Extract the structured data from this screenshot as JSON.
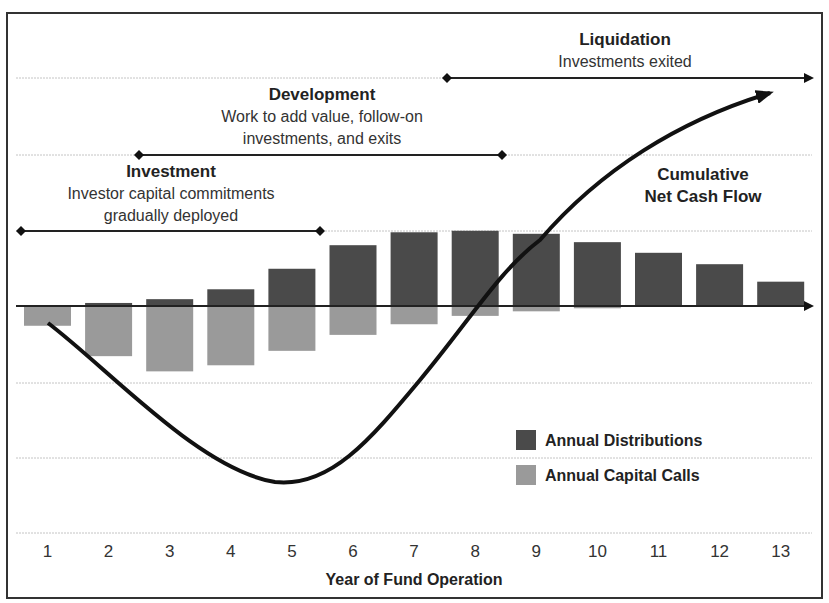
{
  "chart_data": {
    "type": "bar",
    "title": "",
    "xlabel": "Year of Fund Operation",
    "ylabel": "",
    "categories": [
      "1",
      "2",
      "3",
      "4",
      "5",
      "6",
      "7",
      "8",
      "9",
      "10",
      "11",
      "12",
      "13"
    ],
    "series": [
      {
        "name": "Annual Distributions",
        "color": "#4a4a4a",
        "values": [
          0,
          0.04,
          0.09,
          0.22,
          0.49,
          0.8,
          0.97,
          0.99,
          0.95,
          0.84,
          0.7,
          0.55,
          0.32
        ]
      },
      {
        "name": "Annual Capital Calls",
        "color": "#9a9a9a",
        "values": [
          -0.26,
          -0.66,
          -0.86,
          -0.78,
          -0.59,
          -0.38,
          -0.24,
          -0.13,
          -0.07,
          -0.03,
          0,
          0,
          0
        ]
      },
      {
        "name": "Cumulative Net Cash Flow",
        "type": "line",
        "color": "#111111",
        "values": [
          -0.25,
          -1.0,
          -1.7,
          -2.2,
          -2.3,
          -2.1,
          -1.2,
          0.0,
          1.1,
          2.0,
          2.6,
          3.0,
          3.1
        ]
      }
    ],
    "ylim": [
      -3,
      3
    ],
    "grid": true,
    "legend_position": "lower right inside plot",
    "annotations": [
      {
        "label": "Investment",
        "sub": "Investor capital commitments gradually deployed",
        "span": [
          1,
          5.5
        ]
      },
      {
        "label": "Development",
        "sub": "Work to add value, follow-on investments, and exits",
        "span": [
          2.5,
          8.5
        ]
      },
      {
        "label": "Liquidation",
        "sub": "Investments exited",
        "span": [
          7.5,
          13
        ]
      },
      {
        "label": "Cumulative Net Cash Flow"
      }
    ]
  },
  "phases": {
    "investment": {
      "title": "Investment",
      "line1": "Investor capital commitments",
      "line2": "gradually deployed"
    },
    "development": {
      "title": "Development",
      "line1": "Work to add value, follow-on",
      "line2": "investments, and exits"
    },
    "liquidation": {
      "title": "Liquidation",
      "line1": "Investments exited"
    }
  },
  "curve_label": {
    "line1": "Cumulative",
    "line2": "Net Cash Flow"
  },
  "legend": {
    "distributions": "Annual Distributions",
    "capital_calls": "Annual Capital Calls"
  },
  "axis": {
    "xlabel": "Year of Fund Operation",
    "ticks": [
      "1",
      "2",
      "3",
      "4",
      "5",
      "6",
      "7",
      "8",
      "9",
      "10",
      "11",
      "12",
      "13"
    ]
  },
  "colors": {
    "distributions": "#4a4a4a",
    "capital_calls": "#9a9a9a",
    "curve": "#111111",
    "gridline": "#bbbbbb"
  }
}
